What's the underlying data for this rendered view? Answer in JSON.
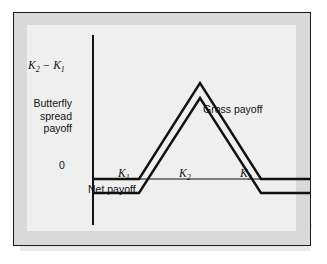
{
  "figure": {
    "background_texture_note": "faint reverse-side print show-through",
    "frame_color": "#1b1b1b",
    "panel_color": "#d9d9d9",
    "plate_color": "#efefef",
    "line_color": "#111111"
  },
  "labels": {
    "vertical_extent": "K₂ − K₁",
    "vertical_extent_parts": {
      "base": "K",
      "sub1": "2",
      "operator": " − ",
      "base2": "K",
      "sub2": "1"
    },
    "axis_title_line1": "Butterfly",
    "axis_title_line2": "spread",
    "axis_title_line3": "payoff",
    "zero": "0",
    "gross_payoff": "Gross payoff",
    "net_payoff": "Net payoff",
    "k1": "K",
    "k1_sub": "1",
    "k2": "K",
    "k2_sub": "2",
    "k3": "K",
    "k3_sub": "3"
  },
  "chart_data": {
    "type": "line",
    "title": "Butterfly spread payoff",
    "xlabel": "",
    "ylabel": "Butterfly spread payoff",
    "grid": false,
    "legend": "inline-annotations",
    "axis": {
      "y_axis_x_px": 79,
      "y_axis_top_px": 22,
      "y_axis_bottom_px": 212,
      "zero_line_y_px": 166,
      "x_start_px": 79,
      "x_end_px": 296
    },
    "x_breakpoints": [
      {
        "name": "K1",
        "label": "K₁",
        "x_px": 125
      },
      {
        "name": "K2",
        "label": "K₂",
        "x_px": 186
      },
      {
        "name": "K3",
        "label": "K₃",
        "x_px": 247
      }
    ],
    "y_levels": {
      "zero_px": 166,
      "net_baseline_px": 180,
      "gross_peak_px": 70,
      "net_peak_px": 85,
      "peak_value_label": "K₂ − K₁"
    },
    "series": [
      {
        "name": "Gross payoff",
        "annotation": "Gross payoff",
        "points_px": [
          {
            "x": 79,
            "y": 166
          },
          {
            "x": 125,
            "y": 166
          },
          {
            "x": 186,
            "y": 70
          },
          {
            "x": 247,
            "y": 166
          },
          {
            "x": 296,
            "y": 166
          }
        ],
        "values": [
          0,
          0,
          1,
          0,
          0
        ],
        "description": "Zero below K1, rises linearly to K2 - K1 at K2, falls back to zero at K3, zero above K3"
      },
      {
        "name": "Net payoff",
        "annotation": "Net payoff",
        "points_px": [
          {
            "x": 79,
            "y": 180
          },
          {
            "x": 125,
            "y": 180
          },
          {
            "x": 186,
            "y": 85
          },
          {
            "x": 247,
            "y": 180
          },
          {
            "x": 296,
            "y": 180
          }
        ],
        "values": [
          -0.15,
          -0.15,
          0.85,
          -0.15,
          -0.15
        ],
        "description": "Gross payoff shifted down by the cost of the spread; negative outside K1 to K3"
      }
    ]
  }
}
